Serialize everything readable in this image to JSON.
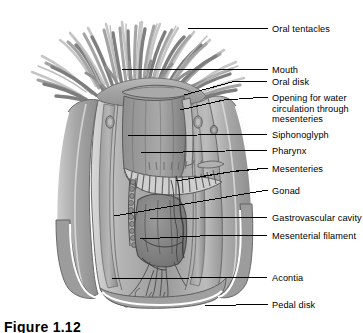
{
  "figure": {
    "caption": "Figure 1.12",
    "background_color": "#ffffff",
    "line_color": "#000000",
    "text_color": "#000000",
    "ink_light": "#c9c9c9",
    "ink_mid": "#a6a6a6",
    "ink_dark": "#7b7b7b",
    "ink_darker": "#5e5e5e"
  },
  "labels": [
    {
      "id": "oral-tentacles",
      "text": "Oral tentacles",
      "x": 272,
      "y": 24,
      "wrap": false
    },
    {
      "id": "mouth",
      "text": "Mouth",
      "x": 272,
      "y": 65,
      "wrap": false
    },
    {
      "id": "oral-disk",
      "text": "Oral disk",
      "x": 272,
      "y": 77,
      "wrap": false
    },
    {
      "id": "opening-for-water",
      "text": "Opening for water circulation through mesenteries",
      "x": 272,
      "y": 93,
      "wrap": true
    },
    {
      "id": "siphonoglyph",
      "text": "Siphonoglyph",
      "x": 272,
      "y": 130,
      "wrap": false
    },
    {
      "id": "pharynx",
      "text": "Pharynx",
      "x": 272,
      "y": 146,
      "wrap": false
    },
    {
      "id": "mesenteries",
      "text": "Mesenteries",
      "x": 272,
      "y": 164,
      "wrap": false
    },
    {
      "id": "gonad",
      "text": "Gonad",
      "x": 272,
      "y": 186,
      "wrap": false
    },
    {
      "id": "gastrovascular-cavity",
      "text": "Gastrovascular cavity",
      "x": 272,
      "y": 213,
      "wrap": false
    },
    {
      "id": "mesenterial-filament",
      "text": "Mesenterial filament",
      "x": 272,
      "y": 231,
      "wrap": false
    },
    {
      "id": "acontia",
      "text": "Acontia",
      "x": 272,
      "y": 273,
      "wrap": false
    },
    {
      "id": "pedal-disk",
      "text": "Pedal disk",
      "x": 272,
      "y": 300,
      "wrap": false
    }
  ],
  "leaders": [
    {
      "id": "leader-oral-tentacles",
      "points": "188,28 268,28"
    },
    {
      "id": "leader-mouth",
      "points": "122,69 268,69"
    },
    {
      "id": "leader-oral-disk",
      "points": "184,95 232,82 268,81"
    },
    {
      "id": "leader-opening-for-water",
      "points": "180,110 224,100 268,97"
    },
    {
      "id": "leader-siphonoglyph",
      "points": "128,136 268,134"
    },
    {
      "id": "leader-pharynx",
      "points": "141,153 268,150"
    },
    {
      "id": "leader-mesenteries-a",
      "points": "176,181 230,172 268,168"
    },
    {
      "id": "leader-mesenteries-b",
      "points": "204,176 236,171 268,168"
    },
    {
      "id": "leader-gonad",
      "points": "114,216 268,190"
    },
    {
      "id": "leader-gastrovascular-cavity",
      "points": "150,219 200,218 268,217"
    },
    {
      "id": "leader-mesenterial-filament",
      "points": "140,239 200,236 268,235"
    },
    {
      "id": "leader-acontia",
      "points": "112,279 268,277"
    },
    {
      "id": "leader-pedal-disk",
      "points": "205,306 268,304"
    }
  ]
}
